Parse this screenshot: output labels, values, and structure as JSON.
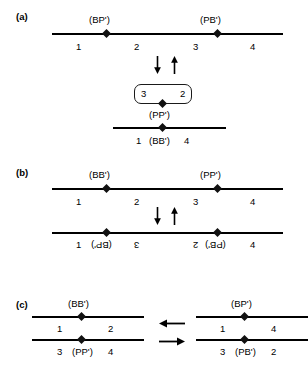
{
  "figure": {
    "title": "Chromosomal recombination / inversion schematic",
    "background_color": "#ffffff",
    "line_color": "#000000",
    "marker_color": "#111111"
  },
  "panels": {
    "a": {
      "label": "(a)",
      "top_row": {
        "markers": [
          {
            "name": "BP-prime",
            "label": "(BP')"
          },
          {
            "name": "PB-prime",
            "label": "(PB')"
          }
        ],
        "segments": [
          "1",
          "2",
          "3",
          "4"
        ]
      },
      "arrows": {
        "down": "↓",
        "up": "↑"
      },
      "excised_box": {
        "left_segment": "3",
        "right_segment": "2",
        "marker_label": "(PP')"
      },
      "bottom_row": {
        "marker_label": "(BB')",
        "left_segment": "1",
        "right_segment": "4"
      }
    },
    "b": {
      "label": "(b)",
      "top_row": {
        "markers": [
          {
            "name": "BB-prime",
            "label": "(BB')"
          },
          {
            "name": "PP-prime",
            "label": "(PP')"
          }
        ],
        "segments": [
          "1",
          "2",
          "3",
          "4"
        ]
      },
      "arrows": {
        "down": "↓",
        "up": "↑"
      },
      "bottom_row": {
        "segment_1": "1",
        "marker_left_label": "(BP')",
        "segment_3_inverted": "3",
        "segment_2_inverted": "2",
        "marker_right_label": "(PB')",
        "segment_4": "4"
      }
    },
    "c": {
      "label": "(c)",
      "arrows": {
        "left": "←",
        "right": "→"
      },
      "left_group": {
        "top_row": {
          "marker_label": "(BB')",
          "left_segment": "1",
          "right_segment": "2"
        },
        "bottom_row": {
          "marker_label": "(PP')",
          "left_segment": "3",
          "right_segment": "4"
        }
      },
      "right_group": {
        "top_row": {
          "marker_label": "(BP')",
          "left_segment": "1",
          "right_segment": "4"
        },
        "bottom_row": {
          "marker_label": "(PB')",
          "left_segment": "3",
          "right_segment": "2"
        }
      }
    }
  }
}
